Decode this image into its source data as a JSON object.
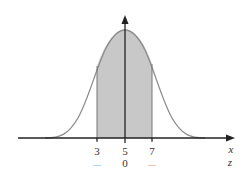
{
  "diagram": {
    "type": "normal-distribution-curve",
    "x_axis_label": "x",
    "z_axis_label": "z",
    "x_ticks": [
      {
        "label": "3",
        "z_label": "....",
        "px": 97
      },
      {
        "label": "5",
        "z_label": "0",
        "px": 125
      },
      {
        "label": "7",
        "z_label": "....",
        "px": 152
      }
    ],
    "shaded_region": {
      "from": "3",
      "to": "7"
    },
    "colors": {
      "curve": "#8c8c8c",
      "fill": "#c8c8c8",
      "axis": "#222222"
    }
  }
}
